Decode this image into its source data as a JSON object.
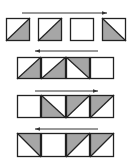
{
  "colors": {
    "fill": "#a6a6a6",
    "stroke": "#222222",
    "arrow": "#333333",
    "background": "#ffffff"
  },
  "rows": [
    {
      "arrow": {
        "direction": "right",
        "x1": 22,
        "x2": 107,
        "y": 13
      },
      "y": 18,
      "h": 23,
      "cells": [
        {
          "x": 6,
          "w": 24,
          "type": "lower-right"
        },
        {
          "x": 38,
          "w": 24,
          "type": "lower-right"
        },
        {
          "x": 70,
          "w": 24,
          "type": "empty"
        },
        {
          "x": 102,
          "w": 24,
          "type": "lower-left"
        }
      ]
    },
    {
      "arrow": {
        "direction": "left",
        "x1": 35,
        "x2": 98,
        "y": 51
      },
      "y": 57,
      "h": 22,
      "cells": [
        {
          "x": 17,
          "w": 24,
          "type": "lower-right"
        },
        {
          "x": 41,
          "w": 25,
          "type": "lower-right"
        },
        {
          "x": 66,
          "w": 24,
          "type": "upper-right"
        },
        {
          "x": 90,
          "w": 24,
          "type": "empty"
        }
      ]
    },
    {
      "arrow": {
        "direction": "right",
        "x1": 35,
        "x2": 98,
        "y": 91
      },
      "y": 95,
      "h": 23,
      "cells": [
        {
          "x": 17,
          "w": 24,
          "type": "empty"
        },
        {
          "x": 41,
          "w": 25,
          "type": "lower-left"
        },
        {
          "x": 66,
          "w": 24,
          "type": "upper-left"
        },
        {
          "x": 90,
          "w": 24,
          "type": "upper-left"
        }
      ]
    },
    {
      "arrow": {
        "direction": "left",
        "x1": 35,
        "x2": 98,
        "y": 129
      },
      "y": 133,
      "h": 24,
      "cells": [
        {
          "x": 17,
          "w": 24,
          "type": "upper-right"
        },
        {
          "x": 41,
          "w": 25,
          "type": "empty"
        },
        {
          "x": 66,
          "w": 24,
          "type": "upper-left"
        },
        {
          "x": 90,
          "w": 24,
          "type": "upper-left"
        }
      ]
    }
  ]
}
